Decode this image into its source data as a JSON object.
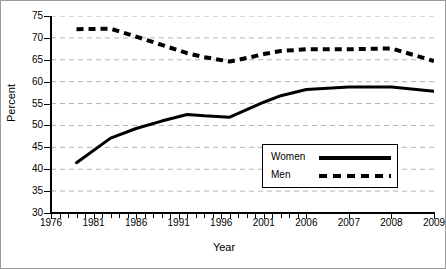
{
  "chart_data": {
    "type": "line",
    "title": "",
    "xlabel": "Year",
    "ylabel": "Percent",
    "xlim": [
      1976,
      2009
    ],
    "ylim": [
      30,
      75
    ],
    "yticks": [
      30,
      35,
      40,
      45,
      50,
      55,
      60,
      65,
      70,
      75
    ],
    "xticks": [
      1976,
      1981,
      1986,
      1991,
      1996,
      2001,
      2006,
      2007,
      2008,
      2009
    ],
    "xtick_labels": [
      "1976",
      "1981",
      "1986",
      "1991",
      "1996",
      "2001",
      "2006",
      "2007",
      "2008",
      "2009"
    ],
    "x_axis_note": "Axis is categorical-spaced: 5-year steps to 2006, then yearly 2007-2009; minor ticks mark each intermediate year",
    "grid": "horizontal dashed gridlines at every y tick",
    "legend_position": "center-right inside plot",
    "series": [
      {
        "name": "Women",
        "style": "solid",
        "color": "#000000",
        "x": [
          1979,
          1983,
          1986,
          1989,
          1992,
          1994,
          1997,
          1999,
          2001,
          2003,
          2006,
          2007,
          2008,
          2009
        ],
        "values": [
          41.5,
          47.1,
          49.3,
          51.0,
          52.5,
          52.2,
          51.9,
          53.6,
          55.3,
          56.8,
          58.2,
          58.8,
          58.8,
          57.8
        ]
      },
      {
        "name": "Men",
        "style": "dashed",
        "color": "#000000",
        "x": [
          1979,
          1983,
          1986,
          1989,
          1992,
          1994,
          1997,
          1999,
          2001,
          2003,
          2006,
          2007,
          2008,
          2009
        ],
        "values": [
          72.0,
          72.1,
          70.3,
          68.4,
          66.5,
          65.6,
          64.6,
          65.4,
          66.3,
          67.0,
          67.4,
          67.4,
          67.6,
          64.7
        ]
      }
    ]
  },
  "legend": {
    "items": [
      {
        "label": "Women",
        "style": "solid"
      },
      {
        "label": "Men",
        "style": "dashed"
      }
    ]
  },
  "axes": {
    "x_title": "Year",
    "y_title": "Percent"
  },
  "colors": {
    "line": "#000000",
    "grid": "#b4b4b4",
    "border": "#9a9a9a",
    "background": "#ffffff"
  }
}
